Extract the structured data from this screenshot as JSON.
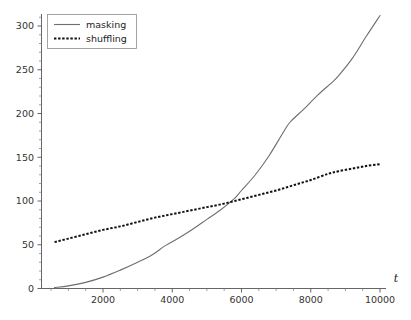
{
  "chart_data": {
    "type": "line",
    "title": "",
    "xlabel": "t",
    "ylabel": "",
    "xlim": [
      0,
      10400
    ],
    "ylim": [
      0,
      318
    ],
    "grid": false,
    "legend_position": "top-left",
    "x_ticks": [
      2000,
      4000,
      6000,
      8000,
      10000
    ],
    "x_tick_labels": [
      "2000",
      "4000",
      "6000",
      "8000",
      "10000"
    ],
    "y_ticks": [
      0,
      50,
      100,
      150,
      200,
      250,
      300
    ],
    "y_tick_labels": [
      "0",
      "50",
      "100",
      "150",
      "200",
      "250",
      "300"
    ],
    "x_minor_step": 500,
    "y_minor_step": 10,
    "series": [
      {
        "name": "masking",
        "style": "solid",
        "color": "#6e6e6e",
        "x": [
          600,
          1000,
          1500,
          2000,
          2500,
          3000,
          3400,
          3800,
          4200,
          4600,
          5000,
          5400,
          5800,
          6000,
          6400,
          6800,
          7200,
          7400,
          7800,
          8200,
          8600,
          8800,
          9200,
          9600,
          10000
        ],
        "y": [
          1,
          3,
          7,
          13,
          21,
          30,
          38,
          49,
          58,
          68,
          79,
          90,
          103,
          112,
          130,
          152,
          178,
          190,
          205,
          221,
          235,
          243,
          263,
          288,
          312
        ]
      },
      {
        "name": "shuffling",
        "style": "dashed",
        "color": "#111111",
        "x": [
          600,
          1000,
          1500,
          2000,
          2500,
          3000,
          3500,
          4000,
          4500,
          5000,
          5500,
          6000,
          6500,
          7000,
          7500,
          8000,
          8500,
          8800,
          9200,
          9600,
          10000
        ],
        "y": [
          53,
          57,
          62,
          67,
          71,
          76,
          81,
          85,
          89,
          93,
          97,
          102,
          107,
          112,
          118,
          124,
          131,
          134,
          137,
          140,
          142
        ]
      }
    ],
    "annotations": [
      {
        "text": "curves cross near t=5700 at value 100"
      }
    ]
  },
  "legend": {
    "entries": [
      {
        "label": "masking"
      },
      {
        "label": "shuffling"
      }
    ]
  },
  "axes": {
    "x_axis_label": "t"
  }
}
